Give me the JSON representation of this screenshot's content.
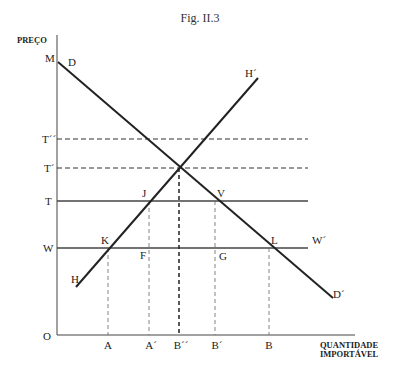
{
  "figure": {
    "title": "Fig. II.3",
    "y_axis_label": "PREÇO",
    "x_axis_label_line1": "QUANTIDADE",
    "x_axis_label_line2": "IMPORTÁVEL",
    "origin_label": "O"
  },
  "curves": {
    "demand": {
      "start_label": "D",
      "end_label": "D´",
      "intercept_label": "M"
    },
    "supply": {
      "start_label": "H",
      "end_label": "H´"
    }
  },
  "price_levels": [
    {
      "label": "T´´",
      "style": "dashed"
    },
    {
      "label": "T´",
      "style": "dashed"
    },
    {
      "label": "T",
      "style": "solid"
    },
    {
      "label": "W",
      "style": "solid",
      "end_label": "W´"
    }
  ],
  "points": {
    "J": "J",
    "V": "V",
    "K": "K",
    "F": "F",
    "G": "G",
    "L": "L"
  },
  "quantity_marks": [
    "A",
    "A´",
    "B´´",
    "B´",
    "B"
  ]
}
